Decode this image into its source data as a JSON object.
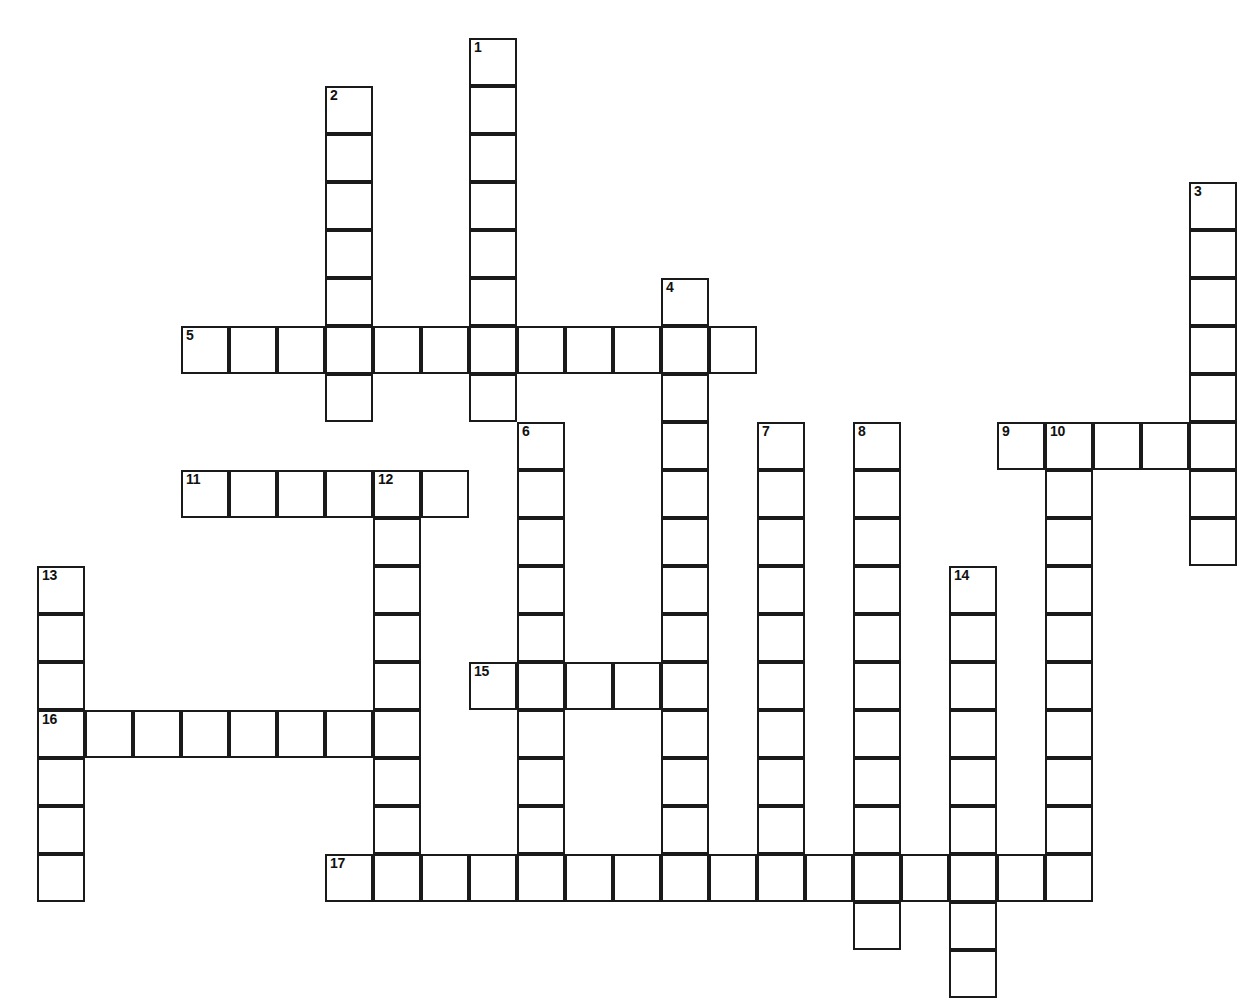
{
  "page": {
    "type": "crossword-grid",
    "background_color": "#ffffff",
    "cell_border_color": "#1a1a1a",
    "cell_fill_color": "#ffffff",
    "number_color": "#111111"
  },
  "grid": {
    "cell_size": 48,
    "origin_x": 37,
    "origin_y": 38,
    "columns": 26,
    "rows": 20,
    "numbered_clue_count": 17
  },
  "numbers": [
    {
      "n": "1",
      "col": 9,
      "row": 0
    },
    {
      "n": "2",
      "col": 6,
      "row": 1
    },
    {
      "n": "3",
      "col": 24,
      "row": 3
    },
    {
      "n": "4",
      "col": 13,
      "row": 5
    },
    {
      "n": "5",
      "col": 3,
      "row": 6
    },
    {
      "n": "6",
      "col": 10,
      "row": 8
    },
    {
      "n": "7",
      "col": 15,
      "row": 8
    },
    {
      "n": "8",
      "col": 17,
      "row": 8
    },
    {
      "n": "9",
      "col": 20,
      "row": 8
    },
    {
      "n": "10",
      "col": 21,
      "row": 8
    },
    {
      "n": "11",
      "col": 3,
      "row": 9
    },
    {
      "n": "12",
      "col": 7,
      "row": 9
    },
    {
      "n": "13",
      "col": 0,
      "row": 11
    },
    {
      "n": "14",
      "col": 19,
      "row": 11
    },
    {
      "n": "15",
      "col": 9,
      "row": 13
    },
    {
      "n": "16",
      "col": 0,
      "row": 14
    },
    {
      "n": "17",
      "col": 6,
      "row": 17
    }
  ],
  "entries": [
    {
      "id": "1-down",
      "number": "1",
      "direction": "down",
      "col": 9,
      "row": 0,
      "length": 9
    },
    {
      "id": "2-down",
      "number": "2",
      "direction": "down",
      "col": 6,
      "row": 1,
      "length": 7
    },
    {
      "id": "3-down",
      "number": "3",
      "direction": "down",
      "col": 24,
      "row": 3,
      "length": 8
    },
    {
      "id": "4-down",
      "number": "4",
      "direction": "down",
      "col": 13,
      "row": 5,
      "length": 13
    },
    {
      "id": "5-across",
      "number": "5",
      "direction": "across",
      "col": 3,
      "row": 6,
      "length": 12
    },
    {
      "id": "6-down",
      "number": "6",
      "direction": "down",
      "col": 10,
      "row": 8,
      "length": 10
    },
    {
      "id": "7-down",
      "number": "7",
      "direction": "down",
      "col": 15,
      "row": 8,
      "length": 10
    },
    {
      "id": "8-down",
      "number": "8",
      "direction": "down",
      "col": 17,
      "row": 8,
      "length": 11
    },
    {
      "id": "9-across",
      "number": "9",
      "direction": "across",
      "col": 20,
      "row": 8,
      "length": 5
    },
    {
      "id": "10-down",
      "number": "10",
      "direction": "down",
      "col": 21,
      "row": 8,
      "length": 10
    },
    {
      "id": "11-across",
      "number": "11",
      "direction": "across",
      "col": 3,
      "row": 9,
      "length": 6
    },
    {
      "id": "12-down",
      "number": "12",
      "direction": "down",
      "col": 7,
      "row": 9,
      "length": 9
    },
    {
      "id": "13-down",
      "number": "13",
      "direction": "down",
      "col": 0,
      "row": 11,
      "length": 7
    },
    {
      "id": "14-down",
      "number": "14",
      "direction": "down",
      "col": 19,
      "row": 11,
      "length": 9
    },
    {
      "id": "15-across",
      "number": "15",
      "direction": "across",
      "col": 9,
      "row": 13,
      "length": 5
    },
    {
      "id": "16-across",
      "number": "16",
      "direction": "across",
      "col": 0,
      "row": 14,
      "length": 8
    },
    {
      "id": "17-across",
      "number": "17",
      "direction": "across",
      "col": 6,
      "row": 17,
      "length": 16
    }
  ],
  "cells": [
    {
      "col": 9,
      "row": 0,
      "num": "1"
    },
    {
      "col": 9,
      "row": 1
    },
    {
      "col": 6,
      "row": 1,
      "num": "2"
    },
    {
      "col": 9,
      "row": 2
    },
    {
      "col": 6,
      "row": 2
    },
    {
      "col": 9,
      "row": 3
    },
    {
      "col": 6,
      "row": 3
    },
    {
      "col": 24,
      "row": 3,
      "num": "3"
    },
    {
      "col": 9,
      "row": 4
    },
    {
      "col": 6,
      "row": 4
    },
    {
      "col": 24,
      "row": 4
    },
    {
      "col": 9,
      "row": 5
    },
    {
      "col": 6,
      "row": 5
    },
    {
      "col": 13,
      "row": 5,
      "num": "4"
    },
    {
      "col": 24,
      "row": 5
    },
    {
      "col": 3,
      "row": 6,
      "num": "5"
    },
    {
      "col": 4,
      "row": 6
    },
    {
      "col": 5,
      "row": 6
    },
    {
      "col": 6,
      "row": 6
    },
    {
      "col": 7,
      "row": 6
    },
    {
      "col": 8,
      "row": 6
    },
    {
      "col": 9,
      "row": 6
    },
    {
      "col": 10,
      "row": 6
    },
    {
      "col": 11,
      "row": 6
    },
    {
      "col": 12,
      "row": 6
    },
    {
      "col": 13,
      "row": 6
    },
    {
      "col": 14,
      "row": 6
    },
    {
      "col": 24,
      "row": 6
    },
    {
      "col": 9,
      "row": 7
    },
    {
      "col": 6,
      "row": 7
    },
    {
      "col": 13,
      "row": 7
    },
    {
      "col": 24,
      "row": 7
    },
    {
      "col": 10,
      "row": 8,
      "num": "6"
    },
    {
      "col": 13,
      "row": 8
    },
    {
      "col": 15,
      "row": 8,
      "num": "7"
    },
    {
      "col": 17,
      "row": 8,
      "num": "8"
    },
    {
      "col": 20,
      "row": 8,
      "num": "9"
    },
    {
      "col": 21,
      "row": 8,
      "num": "10"
    },
    {
      "col": 22,
      "row": 8
    },
    {
      "col": 23,
      "row": 8
    },
    {
      "col": 24,
      "row": 8
    },
    {
      "col": 3,
      "row": 9,
      "num": "11"
    },
    {
      "col": 4,
      "row": 9
    },
    {
      "col": 5,
      "row": 9
    },
    {
      "col": 6,
      "row": 9
    },
    {
      "col": 7,
      "row": 9,
      "num": "12"
    },
    {
      "col": 8,
      "row": 9
    },
    {
      "col": 10,
      "row": 9
    },
    {
      "col": 13,
      "row": 9
    },
    {
      "col": 15,
      "row": 9
    },
    {
      "col": 17,
      "row": 9
    },
    {
      "col": 21,
      "row": 9
    },
    {
      "col": 24,
      "row": 9
    },
    {
      "col": 7,
      "row": 10
    },
    {
      "col": 10,
      "row": 10
    },
    {
      "col": 13,
      "row": 10
    },
    {
      "col": 15,
      "row": 10
    },
    {
      "col": 17,
      "row": 10
    },
    {
      "col": 21,
      "row": 10
    },
    {
      "col": 24,
      "row": 10
    },
    {
      "col": 0,
      "row": 11,
      "num": "13"
    },
    {
      "col": 7,
      "row": 11
    },
    {
      "col": 10,
      "row": 11
    },
    {
      "col": 13,
      "row": 11
    },
    {
      "col": 15,
      "row": 11
    },
    {
      "col": 17,
      "row": 11
    },
    {
      "col": 19,
      "row": 11,
      "num": "14"
    },
    {
      "col": 21,
      "row": 11
    },
    {
      "col": 0,
      "row": 12
    },
    {
      "col": 7,
      "row": 12
    },
    {
      "col": 10,
      "row": 12
    },
    {
      "col": 13,
      "row": 12
    },
    {
      "col": 15,
      "row": 12
    },
    {
      "col": 17,
      "row": 12
    },
    {
      "col": 19,
      "row": 12
    },
    {
      "col": 21,
      "row": 12
    },
    {
      "col": 0,
      "row": 13
    },
    {
      "col": 7,
      "row": 13
    },
    {
      "col": 9,
      "row": 13,
      "num": "15"
    },
    {
      "col": 10,
      "row": 13
    },
    {
      "col": 11,
      "row": 13
    },
    {
      "col": 12,
      "row": 13
    },
    {
      "col": 13,
      "row": 13
    },
    {
      "col": 15,
      "row": 13
    },
    {
      "col": 17,
      "row": 13
    },
    {
      "col": 19,
      "row": 13
    },
    {
      "col": 21,
      "row": 13
    },
    {
      "col": 0,
      "row": 14,
      "num": "16"
    },
    {
      "col": 1,
      "row": 14
    },
    {
      "col": 2,
      "row": 14
    },
    {
      "col": 3,
      "row": 14
    },
    {
      "col": 4,
      "row": 14
    },
    {
      "col": 5,
      "row": 14
    },
    {
      "col": 6,
      "row": 14
    },
    {
      "col": 7,
      "row": 14
    },
    {
      "col": 10,
      "row": 14
    },
    {
      "col": 13,
      "row": 14
    },
    {
      "col": 15,
      "row": 14
    },
    {
      "col": 17,
      "row": 14
    },
    {
      "col": 19,
      "row": 14
    },
    {
      "col": 21,
      "row": 14
    },
    {
      "col": 0,
      "row": 15
    },
    {
      "col": 7,
      "row": 15
    },
    {
      "col": 10,
      "row": 15
    },
    {
      "col": 13,
      "row": 15
    },
    {
      "col": 15,
      "row": 15
    },
    {
      "col": 17,
      "row": 15
    },
    {
      "col": 19,
      "row": 15
    },
    {
      "col": 21,
      "row": 15
    },
    {
      "col": 0,
      "row": 16
    },
    {
      "col": 7,
      "row": 16
    },
    {
      "col": 10,
      "row": 16
    },
    {
      "col": 13,
      "row": 16
    },
    {
      "col": 15,
      "row": 16
    },
    {
      "col": 17,
      "row": 16
    },
    {
      "col": 19,
      "row": 16
    },
    {
      "col": 21,
      "row": 16
    },
    {
      "col": 0,
      "row": 17
    },
    {
      "col": 6,
      "row": 17,
      "num": "17"
    },
    {
      "col": 7,
      "row": 17
    },
    {
      "col": 8,
      "row": 17
    },
    {
      "col": 9,
      "row": 17
    },
    {
      "col": 10,
      "row": 17
    },
    {
      "col": 11,
      "row": 17
    },
    {
      "col": 12,
      "row": 17
    },
    {
      "col": 13,
      "row": 17
    },
    {
      "col": 14,
      "row": 17
    },
    {
      "col": 15,
      "row": 17
    },
    {
      "col": 16,
      "row": 17
    },
    {
      "col": 17,
      "row": 17
    },
    {
      "col": 18,
      "row": 17
    },
    {
      "col": 19,
      "row": 17
    },
    {
      "col": 20,
      "row": 17
    },
    {
      "col": 21,
      "row": 17
    },
    {
      "col": 17,
      "row": 18
    },
    {
      "col": 19,
      "row": 18
    },
    {
      "col": 19,
      "row": 19
    }
  ]
}
